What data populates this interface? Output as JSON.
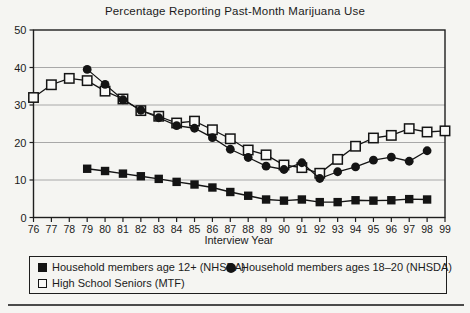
{
  "title": "Percentage Reporting Past-Month Marijuana Use",
  "xlabel": "Interview Year",
  "colors": {
    "line": "#141414",
    "grid": "#a8a8a8",
    "axis": "#1e1e1e",
    "marker_fill_open": "#f9f9f7",
    "background": "#f5f5f2",
    "rule": "#4a4a4a"
  },
  "chart_data": {
    "type": "line",
    "title": "Percentage Reporting Past-Month Marijuana Use",
    "xlabel": "Interview Year",
    "ylabel": "",
    "ylim": [
      0,
      50
    ],
    "yticks": [
      0,
      10,
      20,
      30,
      40,
      50
    ],
    "grid": true,
    "legend_position": "bottom",
    "x_categories": [
      "76",
      "77",
      "78",
      "79",
      "80",
      "81",
      "82",
      "83",
      "84",
      "85",
      "86",
      "87",
      "88",
      "89",
      "90",
      "91",
      "92",
      "93",
      "94",
      "95",
      "96",
      "97",
      "98",
      "99"
    ],
    "series": [
      {
        "name": "Household members age 12+ (NHSDA)",
        "marker": "filled-square",
        "start_year": 79,
        "values": [
          13.0,
          12.4,
          11.7,
          11.0,
          10.3,
          9.5,
          8.8,
          8.0,
          6.8,
          5.8,
          4.8,
          4.5,
          4.8,
          4.1,
          4.1,
          4.6,
          4.5,
          4.6,
          4.9,
          4.8
        ]
      },
      {
        "name": "Household members ages 18–20 (NHSDA)",
        "marker": "filled-circle",
        "start_year": 79,
        "values": [
          39.5,
          35.5,
          31.4,
          28.6,
          26.6,
          24.5,
          23.8,
          21.3,
          18.2,
          16.0,
          13.7,
          12.8,
          14.6,
          10.4,
          12.2,
          13.5,
          15.3,
          16.1,
          15.0,
          17.8
        ]
      },
      {
        "name": "High School Seniors (MTF)",
        "marker": "open-square",
        "start_year": 76,
        "values": [
          32.0,
          35.4,
          37.1,
          36.5,
          33.7,
          31.6,
          28.5,
          27.0,
          25.2,
          25.7,
          23.4,
          21.0,
          18.0,
          16.7,
          14.0,
          13.3,
          11.8,
          15.5,
          19.0,
          21.2,
          21.9,
          23.7,
          22.8,
          23.1
        ]
      }
    ]
  },
  "legend": {
    "item1_label": "Household members age 12+ (NHSDA)",
    "item2_label": "Household members ages 18–20 (NHSDA)",
    "item3_label": "High School Seniors (MTF)"
  }
}
